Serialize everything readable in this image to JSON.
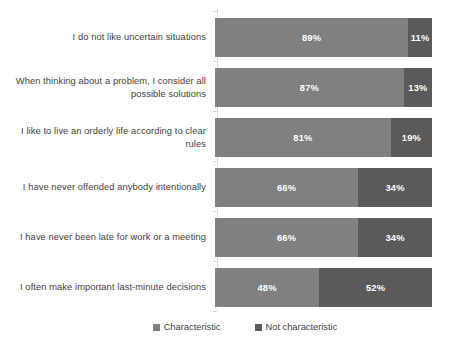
{
  "chart_data": {
    "type": "bar",
    "subtype": "stacked-horizontal-100pct",
    "title": "",
    "xlabel": "",
    "ylabel": "",
    "xlim": [
      0,
      100
    ],
    "grid": false,
    "legend_position": "bottom",
    "categories": [
      "I do not like uncertain situations",
      "When thinking about a problem, I consider all possible solutions",
      "I like to live an orderly life according to clear rules",
      "I have never offended anybody intentionally",
      "I have never been late for work or a meeting",
      "I often make important last-minute decisions"
    ],
    "series": [
      {
        "name": "Characteristic",
        "color": "#808080",
        "values": [
          89,
          87,
          81,
          66,
          66,
          48
        ],
        "labels": [
          "89%",
          "87%",
          "81%",
          "66%",
          "66%",
          "48%"
        ]
      },
      {
        "name": "Not characteristic",
        "color": "#5a5a5a",
        "values": [
          11,
          13,
          19,
          34,
          34,
          52
        ],
        "labels": [
          "11%",
          "13%",
          "19%",
          "34%",
          "34%",
          "52%"
        ]
      }
    ]
  },
  "legend": {
    "items": [
      {
        "label": "Characteristic",
        "color": "#808080"
      },
      {
        "label": "Not characteristic",
        "color": "#5a5a5a"
      }
    ]
  },
  "axis": {
    "line_color": "#d9d9d9"
  }
}
